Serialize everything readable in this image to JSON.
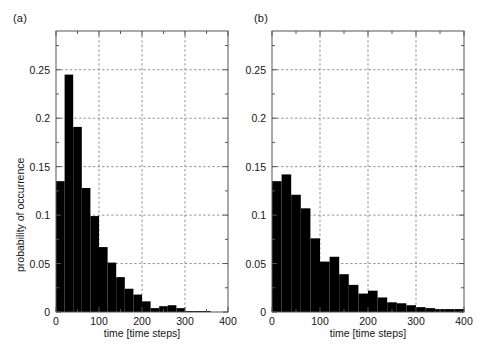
{
  "figure": {
    "background": "#ffffff",
    "bar_color": "#000000",
    "axis_color": "#555555",
    "grid_color": "#777777"
  },
  "panels": [
    {
      "key": "a",
      "label": "(a)",
      "xlabel": "time [time steps]",
      "ylabel": "probability of occurrence",
      "show_ylabel": true,
      "xticks": [
        "0",
        "100",
        "200",
        "300",
        "400"
      ],
      "yticks": [
        "0",
        "0.05",
        "0.1",
        "0.15",
        "0.2",
        "0.25"
      ],
      "chart_data": {
        "type": "bar",
        "title": "(a)",
        "xlabel": "time [time steps]",
        "ylabel": "probability of occurrence",
        "xlim": [
          0,
          400
        ],
        "ylim": [
          0,
          0.29
        ],
        "grid": true,
        "legend": "none",
        "bin_width": 20,
        "xtick_values": [
          0,
          100,
          200,
          300,
          400
        ],
        "ytick_values": [
          0,
          0.05,
          0.1,
          0.15,
          0.2,
          0.25
        ],
        "categories": [
          20,
          40,
          60,
          80,
          100,
          120,
          140,
          160,
          180,
          200,
          220,
          240,
          260,
          280,
          300,
          320,
          340,
          360,
          380,
          400
        ],
        "values": [
          0.135,
          0.245,
          0.191,
          0.128,
          0.099,
          0.067,
          0.051,
          0.036,
          0.024,
          0.018,
          0.011,
          0.004,
          0.006,
          0.007,
          0.004,
          0.001,
          0.001,
          0.001,
          0.0,
          0.0
        ]
      }
    },
    {
      "key": "b",
      "label": "(b)",
      "xlabel": "time [time steps]",
      "ylabel": "",
      "show_ylabel": false,
      "xticks": [
        "0",
        "100",
        "200",
        "300",
        "400"
      ],
      "yticks": [
        "0",
        "0.05",
        "0.1",
        "0.15",
        "0.2",
        "0.25"
      ],
      "chart_data": {
        "type": "bar",
        "title": "(b)",
        "xlabel": "time [time steps]",
        "ylabel": "",
        "xlim": [
          0,
          400
        ],
        "ylim": [
          0,
          0.29
        ],
        "grid": true,
        "legend": "none",
        "bin_width": 20,
        "xtick_values": [
          0,
          100,
          200,
          300,
          400
        ],
        "ytick_values": [
          0,
          0.05,
          0.1,
          0.15,
          0.2,
          0.25
        ],
        "categories": [
          20,
          40,
          60,
          80,
          100,
          120,
          140,
          160,
          180,
          200,
          220,
          240,
          260,
          280,
          300,
          320,
          340,
          360,
          380,
          400
        ],
        "values": [
          0.135,
          0.142,
          0.121,
          0.107,
          0.076,
          0.052,
          0.057,
          0.039,
          0.028,
          0.019,
          0.022,
          0.015,
          0.01,
          0.009,
          0.007,
          0.005,
          0.004,
          0.003,
          0.003,
          0.003
        ]
      }
    }
  ]
}
